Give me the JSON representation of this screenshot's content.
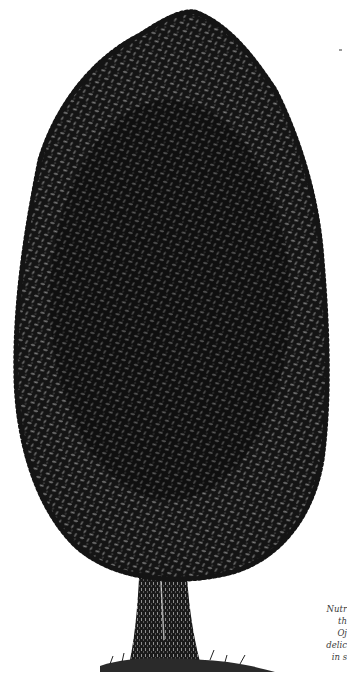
{
  "illustration": {
    "subject": "engraved tree with dense oval canopy and forked trunk",
    "colors": {
      "ink": "#111111",
      "leaf_highlight": "#8a8a8a",
      "paper": "#ffffff"
    }
  },
  "caption": {
    "lines": [
      "Nutr",
      "th",
      "Oj",
      "delic",
      "in s"
    ]
  }
}
